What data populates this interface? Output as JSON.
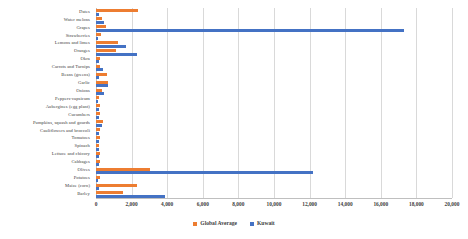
{
  "chart_data": {
    "type": "bar",
    "orientation": "horizontal",
    "title": "",
    "subtitle": "",
    "xlabel": "",
    "ylabel": "",
    "xlim": [
      0,
      20000
    ],
    "xticks": [
      0,
      2000,
      4000,
      6000,
      8000,
      10000,
      12000,
      14000,
      16000,
      18000,
      20000
    ],
    "xticklabels": [
      "0",
      "2,000",
      "4,000",
      "6,000",
      "8,000",
      "10,000",
      "12,000",
      "14,000",
      "16,000",
      "18,000",
      "20,000"
    ],
    "grid": true,
    "grid_axis": "x",
    "legend": {
      "position": "bottom",
      "entries": [
        {
          "name": "Global Average",
          "color": "#ed7d31"
        },
        {
          "name": "Kuwait",
          "color": "#4472c4"
        }
      ]
    },
    "categories": [
      "Dates",
      "Water melons",
      "Grapes",
      "Strawberries",
      "Lemons and limes",
      "Oranges",
      "Okra",
      "Carrots and Turnips",
      "Beans (greens)",
      "Garlic",
      "Onions",
      "Peppers-capsicum",
      "Aubergines (egg plant)",
      "Cucumbers",
      "Pumpkins, squash and gourds",
      "Cauliflowers and broccoli",
      "Tomatoes",
      "Spinach",
      "Lettuce and chicory",
      "Cabbages",
      "Olives",
      "Potatoes",
      "Maize (corn)",
      "Barley"
    ],
    "series": [
      {
        "name": "Global Average",
        "color": "#ed7d31",
        "values": [
          2380,
          310,
          560,
          260,
          1210,
          1110,
          230,
          240,
          620,
          690,
          360,
          180,
          230,
          210,
          380,
          230,
          250,
          190,
          200,
          250,
          3020,
          230,
          2280,
          1500
        ]
      },
      {
        "name": "Kuwait",
        "color": "#4472c4",
        "values": [
          160,
          450,
          17300,
          110,
          1710,
          2290,
          180,
          420,
          170,
          680,
          470,
          120,
          170,
          160,
          330,
          180,
          160,
          150,
          170,
          180,
          12200,
          130,
          170,
          3880
        ]
      }
    ]
  }
}
